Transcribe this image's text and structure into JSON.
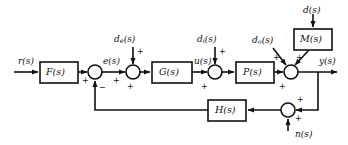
{
  "diagram": {
    "type": "block-diagram",
    "stroke_color": "#111111",
    "fill_color": "#ffffff",
    "background": "#ffffff"
  },
  "blocks": [
    {
      "id": "F",
      "label": "F(s)",
      "name": "prefilter-block",
      "x": 40,
      "y": 62,
      "w": 38,
      "h": 21
    },
    {
      "id": "G",
      "label": "G(s)",
      "name": "controller-block",
      "x": 152,
      "y": 62,
      "w": 40,
      "h": 21
    },
    {
      "id": "P",
      "label": "P(s)",
      "name": "plant-block",
      "x": 236,
      "y": 62,
      "w": 38,
      "h": 21
    },
    {
      "id": "H",
      "label": "H(s)",
      "name": "feedback-block",
      "x": 208,
      "y": 100,
      "w": 38,
      "h": 21
    },
    {
      "id": "M",
      "label": "M(s)",
      "name": "disturbance-model-block",
      "x": 294,
      "y": 29,
      "w": 38,
      "h": 21
    }
  ],
  "junctions": [
    {
      "id": "sum1",
      "name": "error-summing-junction",
      "cx": 95,
      "cy": 72,
      "r": 7
    },
    {
      "id": "sum2",
      "name": "controller-disturbance-junction",
      "cx": 133,
      "cy": 72,
      "r": 7
    },
    {
      "id": "sum3",
      "name": "input-disturbance-junction",
      "cx": 215,
      "cy": 72,
      "r": 7
    },
    {
      "id": "sum4",
      "name": "output-disturbance-junction",
      "cx": 291,
      "cy": 72,
      "r": 7
    },
    {
      "id": "sum5",
      "name": "noise-summing-junction",
      "cx": 288,
      "cy": 110,
      "r": 7
    }
  ],
  "signals": {
    "reference": "r(s)",
    "error": "e(s)",
    "control": "u(s)",
    "output": "y(s)",
    "noise": "n(s)",
    "disturbance": "d(s)",
    "disturbance_controller_main": "d",
    "disturbance_controller_sub": "e",
    "disturbance_input_main": "d",
    "disturbance_input_sub": "i",
    "disturbance_output_main": "d",
    "disturbance_output_sub": "o",
    "paren": "(s)"
  },
  "signs": {
    "plus": "+",
    "minus": "−"
  },
  "sign_markers": [
    {
      "name": "sign-plus-prefilter-to-sum1",
      "text": "+",
      "x": 82,
      "y": 77
    },
    {
      "name": "sign-minus-feedback-to-sum1",
      "text": "−",
      "x": 99,
      "y": 85
    },
    {
      "name": "sign-plus-sum1-to-sum2",
      "text": "+",
      "x": 115,
      "y": 77
    },
    {
      "name": "sign-plus-de-to-sum2",
      "text": "+",
      "x": 137,
      "y": 50
    },
    {
      "name": "sign-plus-sum2-out",
      "text": "+",
      "x": 127,
      "y": 84
    },
    {
      "name": "sign-plus-u-to-sum3",
      "text": "+",
      "x": 200,
      "y": 84
    },
    {
      "name": "sign-plus-di-to-sum3",
      "text": "+",
      "x": 219,
      "y": 50
    },
    {
      "name": "sign-plus-plant-to-sum4",
      "text": "+",
      "x": 278,
      "y": 84
    },
    {
      "name": "sign-plus-do-to-sum4",
      "text": "+",
      "x": 277,
      "y": 54
    },
    {
      "name": "sign-plus-m-to-sum4",
      "text": "+",
      "x": 296,
      "y": 54
    },
    {
      "name": "sign-plus-y-to-sum5",
      "text": "+",
      "x": 296,
      "y": 98
    },
    {
      "name": "sign-plus-n-to-sum5",
      "text": "+",
      "x": 295,
      "y": 116
    }
  ]
}
